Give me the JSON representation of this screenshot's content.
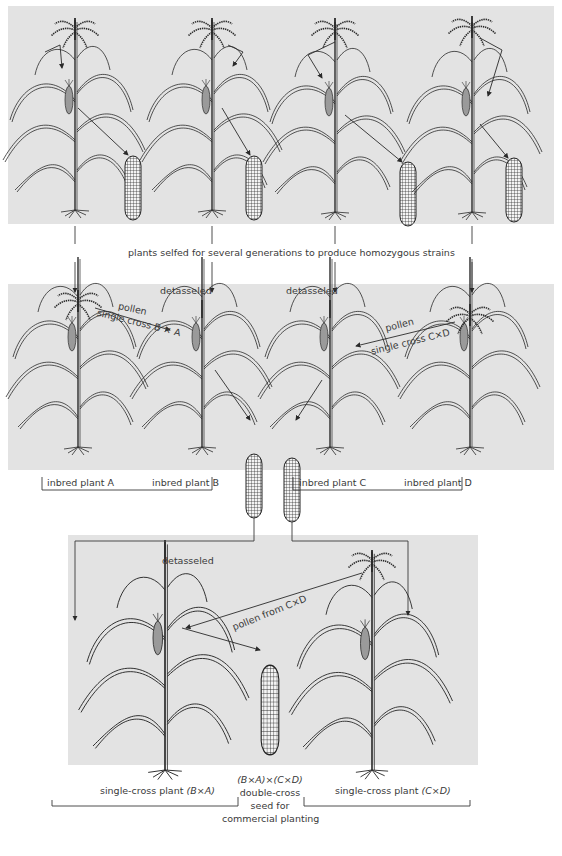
{
  "figure": {
    "caption_top": "plants selfed for several generations to produce homozygous strains",
    "panel_colors": {
      "background": "#e3e3e3",
      "line": "#2a2a2a",
      "page": "#ffffff"
    },
    "row1": {
      "plants": [
        {
          "id": "A",
          "position": 1
        },
        {
          "id": "B",
          "position": 2
        },
        {
          "id": "C",
          "position": 3
        },
        {
          "id": "D",
          "position": 4
        }
      ]
    },
    "row2": {
      "detasseled_left": "detasseled",
      "detasseled_right": "detasseled",
      "cross_left": {
        "pollen": "pollen",
        "label": "single cross B × A"
      },
      "cross_right": {
        "pollen": "pollen",
        "label": "single cross C×D"
      },
      "bracket_labels": {
        "a": "inbred plant A",
        "b": "inbred plant B",
        "c": "inbred plant C",
        "d": "inbred plant D"
      }
    },
    "row3": {
      "detasseled": "detasseled",
      "pollen_label": "pollen from C×D",
      "left_label_prefix": "single-cross plant ",
      "left_label_formula": "(B×A)",
      "right_label_prefix": "single-cross plant ",
      "right_label_formula": "(C×D)",
      "center_formula": "(B×A)×(C×D)",
      "center_line1": "double-cross",
      "center_line2": "seed for",
      "center_line3": "commercial planting"
    }
  }
}
